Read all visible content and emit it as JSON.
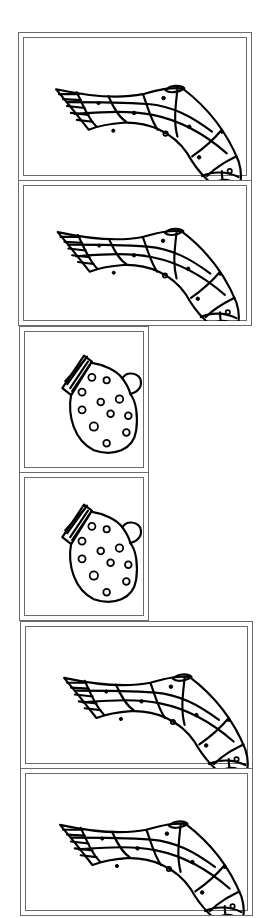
{
  "worksheet": {
    "description": "Matching pairs worksheet: stockings and mittens line art",
    "cards": [
      {
        "id": 1,
        "type": "stocking",
        "label": "stocking"
      },
      {
        "id": 2,
        "type": "stocking",
        "label": "stocking"
      },
      {
        "id": 3,
        "type": "mitten",
        "label": "mitten"
      },
      {
        "id": 4,
        "type": "mitten",
        "label": "mitten"
      },
      {
        "id": 5,
        "type": "stocking",
        "label": "stocking"
      },
      {
        "id": 6,
        "type": "stocking",
        "label": "stocking"
      }
    ],
    "colors": {
      "ink": "#000000",
      "frame": "#6a6a6a",
      "background": "#ffffff"
    }
  }
}
